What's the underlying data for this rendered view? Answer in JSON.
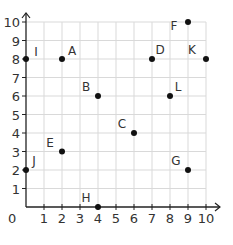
{
  "chart_data": {
    "type": "scatter",
    "title": "",
    "xlabel": "",
    "ylabel": "",
    "xlim": [
      0,
      10
    ],
    "ylim": [
      0,
      10
    ],
    "grid": true,
    "x_ticks": [
      "0",
      "1",
      "2",
      "3",
      "4",
      "5",
      "6",
      "7",
      "8",
      "9",
      "10"
    ],
    "y_ticks": [
      "1",
      "2",
      "3",
      "4",
      "5",
      "6",
      "7",
      "8",
      "9",
      "10"
    ],
    "origin_label": "0",
    "points": [
      {
        "label": "I",
        "x": 0,
        "y": 8
      },
      {
        "label": "A",
        "x": 2,
        "y": 8
      },
      {
        "label": "B",
        "x": 4,
        "y": 6
      },
      {
        "label": "C",
        "x": 6,
        "y": 4
      },
      {
        "label": "D",
        "x": 7,
        "y": 8
      },
      {
        "label": "E",
        "x": 2,
        "y": 3
      },
      {
        "label": "F",
        "x": 9,
        "y": 10
      },
      {
        "label": "G",
        "x": 9,
        "y": 2
      },
      {
        "label": "H",
        "x": 4,
        "y": 0
      },
      {
        "label": "J",
        "x": 0,
        "y": 2
      },
      {
        "label": "K",
        "x": 10,
        "y": 8
      },
      {
        "label": "L",
        "x": 8,
        "y": 6
      }
    ]
  },
  "colors": {
    "grid": "#d9d9d9",
    "axis": "#222222",
    "point": "#111111",
    "text": "#333333"
  }
}
